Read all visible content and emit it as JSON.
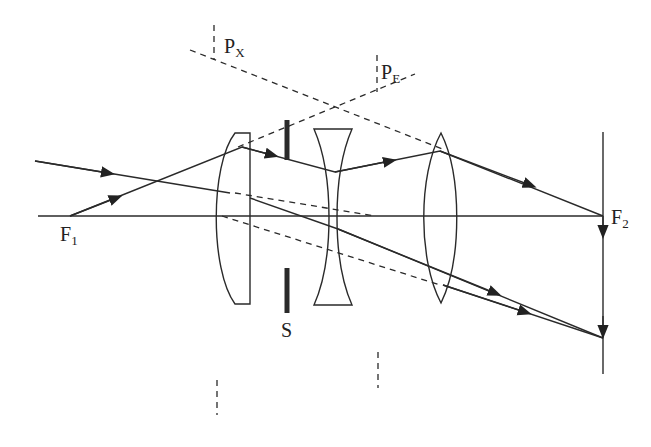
{
  "diagram": {
    "type": "optical-ray-diagram",
    "labels": {
      "px": {
        "main": "P",
        "sub": "X"
      },
      "pe": {
        "main": "P",
        "sub": "E"
      },
      "f1": {
        "main": "F",
        "sub": "1"
      },
      "f2": {
        "main": "F",
        "sub": "2"
      },
      "s": {
        "main": "S"
      }
    },
    "components": [
      "optical-axis",
      "plano-convex-lens",
      "aperture-stop-S",
      "biconcave-lens",
      "biconvex-lens",
      "image-plane"
    ],
    "colors": {
      "line": "#2a2a2a",
      "background": "#ffffff"
    }
  }
}
